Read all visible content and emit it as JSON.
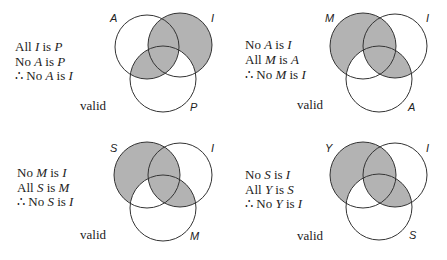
{
  "colors": {
    "shade": "#b3b3b3",
    "stroke": "#333333",
    "background": "#ffffff",
    "text": "#222222"
  },
  "syllogisms": [
    {
      "lines": [
        {
          "prefix": "All ",
          "a": "I",
          "mid": " is ",
          "b": "P"
        },
        {
          "prefix": "No ",
          "a": "A",
          "mid": " is ",
          "b": "P"
        },
        {
          "prefix": "∴ No ",
          "a": "A",
          "mid": " is ",
          "b": "I"
        }
      ],
      "verdict": "valid",
      "circles": {
        "top_left": "A",
        "top_right": "I",
        "bottom": "P"
      },
      "shaded_regions": "I outside P; A inside P"
    },
    {
      "lines": [
        {
          "prefix": "No ",
          "a": "A",
          "mid": " is ",
          "b": "I"
        },
        {
          "prefix": "All ",
          "a": "M",
          "mid": " is ",
          "b": "A"
        },
        {
          "prefix": "∴ No ",
          "a": "M",
          "mid": " is ",
          "b": "I"
        }
      ],
      "verdict": "valid",
      "circles": {
        "top_left": "M",
        "top_right": "I",
        "bottom": "A"
      },
      "shaded_regions": "M outside A; I inside A"
    },
    {
      "lines": [
        {
          "prefix": "No ",
          "a": "M",
          "mid": " is ",
          "b": "I"
        },
        {
          "prefix": "All ",
          "a": "S",
          "mid": " is ",
          "b": "M"
        },
        {
          "prefix": "∴ No ",
          "a": "S",
          "mid": " is ",
          "b": "I"
        }
      ],
      "verdict": "valid",
      "circles": {
        "top_left": "S",
        "top_right": "I",
        "bottom": "M"
      },
      "shaded_regions": "S outside M; I inside M"
    },
    {
      "lines": [
        {
          "prefix": "No ",
          "a": "S",
          "mid": " is ",
          "b": "I"
        },
        {
          "prefix": "All ",
          "a": "Y",
          "mid": " is ",
          "b": "S"
        },
        {
          "prefix": "∴ No ",
          "a": "Y",
          "mid": " is ",
          "b": "I"
        }
      ],
      "verdict": "valid",
      "circles": {
        "top_left": "Y",
        "top_right": "I",
        "bottom": "S"
      },
      "shaded_regions": "Y outside S; I inside S"
    }
  ]
}
